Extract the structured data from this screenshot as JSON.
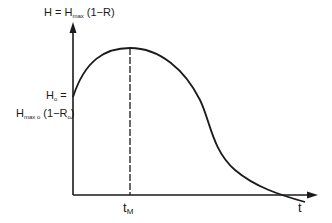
{
  "diagram": {
    "y_axis_label": {
      "main": "H = H",
      "sub": "max",
      "rest": " (1−R)"
    },
    "y_intercept_label": {
      "line1_main": "H",
      "line1_sub": "o",
      "line1_rest": " =",
      "line2_main": "H",
      "line2_sub": "max o",
      "line2_rest": " (1−R",
      "line2_sub2": "o",
      "line2_end": ")"
    },
    "x_marker_label": {
      "main": "t",
      "sub": "M"
    },
    "x_axis_label": "t",
    "colors": {
      "stroke": "#1a1a1a",
      "background": "#ffffff"
    }
  }
}
